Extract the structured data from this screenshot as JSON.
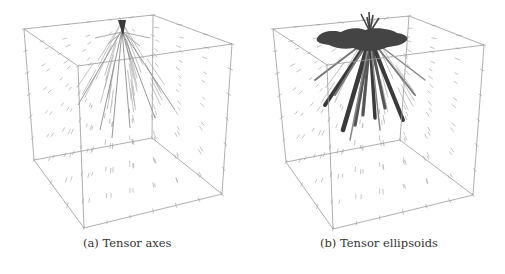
{
  "figure": {
    "panels": [
      {
        "id": "a",
        "caption": "(a) Tensor axes",
        "visualization": "tensor-axes-glyphs",
        "cube": {
          "btl": [
            24,
            29
          ],
          "btr": [
            153,
            15
          ],
          "ftr": [
            232,
            44
          ],
          "ftl": [
            78,
            66
          ],
          "bbl": [
            34,
            160
          ],
          "bbr": [
            152,
            138
          ],
          "fbr": [
            222,
            194
          ],
          "fbl": [
            84,
            228
          ]
        },
        "source_point": [
          122,
          22
        ]
      },
      {
        "id": "b",
        "caption": "(b) Tensor ellipsoids",
        "visualization": "tensor-ellipsoid-glyphs",
        "cube": {
          "btl": [
            18,
            29
          ],
          "btr": [
            154,
            16
          ],
          "ftr": [
            229,
            45
          ],
          "ftl": [
            72,
            65
          ],
          "bbl": [
            31,
            162
          ],
          "bbr": [
            145,
            140
          ],
          "fbr": [
            218,
            195
          ],
          "fbl": [
            78,
            229
          ]
        },
        "source_point": [
          115,
          28
        ]
      }
    ],
    "colors": {
      "cube_edge": "#9a9a9a",
      "glyph_light": "#b5b5b5",
      "glyph_dark": "#3a3a3a",
      "caption_text": "#333333"
    }
  }
}
